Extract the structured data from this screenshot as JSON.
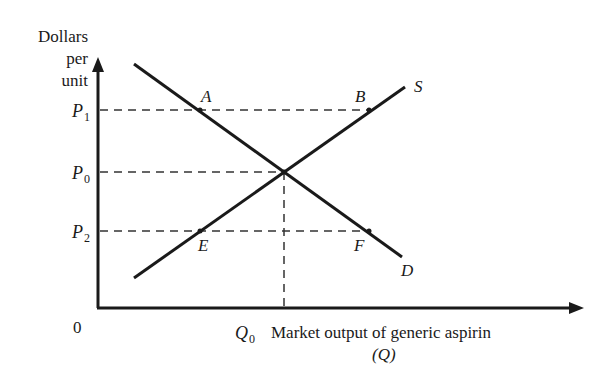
{
  "axes": {
    "y_label_lines": [
      "Dollars",
      "per",
      "unit"
    ],
    "x_label": "Market output of generic aspirin",
    "x_label_sub": "(Q)",
    "origin_label": "0"
  },
  "price_labels": {
    "p1": {
      "base": "P",
      "sub": "1"
    },
    "p0": {
      "base": "P",
      "sub": "0"
    },
    "p2": {
      "base": "P",
      "sub": "2"
    }
  },
  "quantity_labels": {
    "q0": {
      "base": "Q",
      "sub": "0"
    }
  },
  "curves": {
    "supply": {
      "label": "S"
    },
    "demand": {
      "label": "D"
    }
  },
  "points": {
    "A": "A",
    "B": "B",
    "E": "E",
    "F": "F"
  },
  "colors": {
    "line": "#1a1a1a",
    "dash": "#333333"
  }
}
